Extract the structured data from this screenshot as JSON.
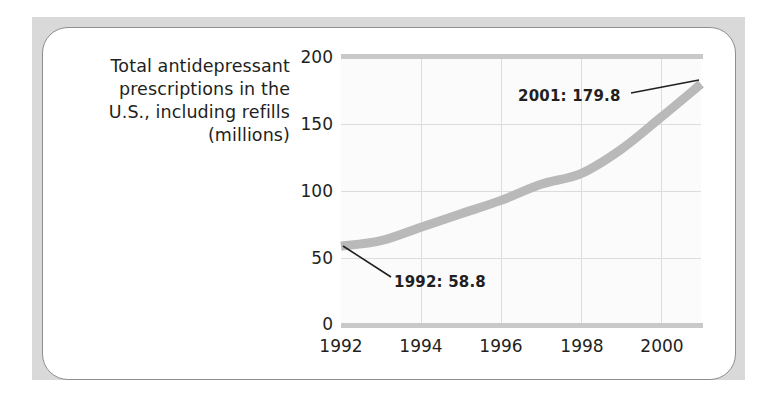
{
  "card": {
    "caption_lines": [
      "Total antidepressant",
      "prescriptions in the",
      "U.S., including refills",
      "(millions)"
    ]
  },
  "colors": {
    "mat": "#d9d9d9",
    "card_border": "#8e8e8e",
    "plot_bg": "#fbfbfb",
    "gridline": "#dcdcdc",
    "axis_rule": "#c9c9c9",
    "series": "#b9b9b9",
    "text": "#231f20",
    "leader_line": "#231f20"
  },
  "chart_data": {
    "type": "line",
    "title": "Total antidepressant prescriptions in the U.S., including refills (millions)",
    "xlabel": "",
    "ylabel": "",
    "xlim": [
      1992,
      2001
    ],
    "ylim": [
      0,
      200
    ],
    "yticks": [
      0,
      50,
      100,
      150,
      200
    ],
    "ytick_labels": [
      "0",
      "50",
      "100",
      "150",
      "200"
    ],
    "xticks": [
      1992,
      1994,
      1996,
      1998,
      2000
    ],
    "xtick_labels": [
      "1992",
      "1994",
      "1996",
      "1998",
      "2000"
    ],
    "grid": true,
    "legend": "none",
    "x": [
      1992,
      1993,
      1994,
      1995,
      1996,
      1997,
      1998,
      1999,
      2000,
      2001
    ],
    "values": [
      58.8,
      63.0,
      73.0,
      83.0,
      93.0,
      105.0,
      113.0,
      131.0,
      155.0,
      179.8
    ],
    "series": [
      {
        "name": "Total antidepressant prescriptions (millions)",
        "values": [
          58.8,
          63.0,
          73.0,
          83.0,
          93.0,
          105.0,
          113.0,
          131.0,
          155.0,
          179.8
        ]
      }
    ],
    "annotations": [
      {
        "id": "start",
        "text": "1992: 58.8",
        "x": 1992,
        "y": 58.8
      },
      {
        "id": "end",
        "text": "2001: 179.8",
        "x": 2001,
        "y": 179.8
      }
    ]
  }
}
